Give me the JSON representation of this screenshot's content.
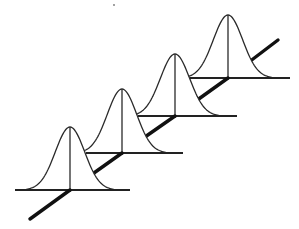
{
  "diagram": {
    "description": "Four identical bell-shaped normal distribution curves placed in perspective along a diagonal regression line",
    "colors": {
      "background": "#ffffff",
      "line": "#2a2a2a",
      "axis": "#111111"
    },
    "axis": {
      "x1": 30,
      "y1": 219,
      "x2": 278,
      "y2": 40
    },
    "distributions": [
      {
        "id": 1,
        "center_x": 70,
        "peak_y": 127,
        "baseline_y": 190,
        "half_width": 44,
        "base_left": 15,
        "base_right": 130
      },
      {
        "id": 2,
        "center_x": 122,
        "peak_y": 89,
        "baseline_y": 153,
        "half_width": 44,
        "base_left": 86,
        "base_right": 183
      },
      {
        "id": 3,
        "center_x": 175,
        "peak_y": 54,
        "baseline_y": 116,
        "half_width": 44,
        "base_left": 138,
        "base_right": 237
      },
      {
        "id": 4,
        "center_x": 228,
        "peak_y": 15,
        "baseline_y": 78,
        "half_width": 44,
        "base_left": 190,
        "base_right": 290
      }
    ],
    "speck": {
      "x": 114,
      "y": 5
    }
  }
}
